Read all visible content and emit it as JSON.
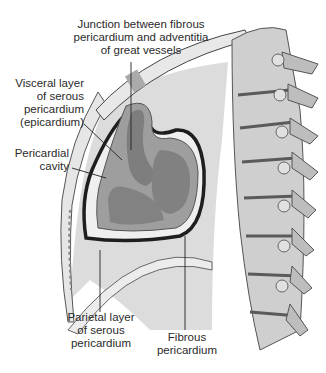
{
  "figure": {
    "labels": {
      "junction": "Junction between fibrous\npericardium and adventitia\nof great vessels",
      "visceral": "Visceral layer\nof serous\npericardium\n(epicardium)",
      "cavity": "Pericardial\ncavity",
      "parietal": "Parietal layer\nof serous\npericardium",
      "fibrous": "Fibrous\npericardium"
    },
    "colors": {
      "background": "#ffffff",
      "mediastinum": "#d9d9d9",
      "heart_fill": "#9b9b9b",
      "chamber_fill": "#7e7e7e",
      "pericardium_dark": "#1e1e1e",
      "bone": "#c8c8c8",
      "bone_shadow": "#8a8a8a",
      "leader_line": "#222222"
    }
  }
}
